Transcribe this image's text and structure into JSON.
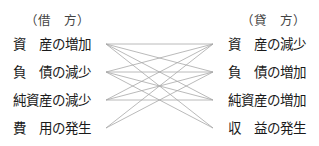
{
  "debit": {
    "header": "（借　方）",
    "items": [
      "資　産の増加",
      "負　債の減少",
      "純資産の減少",
      "費　用の発生"
    ]
  },
  "credit": {
    "header": "（貸　方）",
    "items": [
      "資　産の減少",
      "負　債の増加",
      "純資産の増加",
      "収　益の発生"
    ]
  },
  "connector_color": "#a8a8a8"
}
